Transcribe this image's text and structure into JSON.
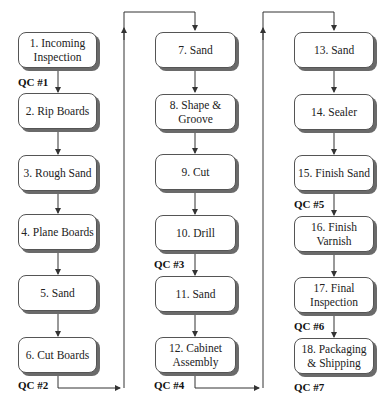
{
  "diagram": {
    "type": "process-flowchart",
    "columns": [
      {
        "steps": [
          {
            "id": 1,
            "label": "1. Incoming Inspection"
          },
          {
            "id": 2,
            "label": "2. Rip Boards"
          },
          {
            "id": 3,
            "label": "3. Rough Sand"
          },
          {
            "id": 4,
            "label": "4. Plane Boards"
          },
          {
            "id": 5,
            "label": "5. Sand"
          },
          {
            "id": 6,
            "label": "6. Cut Boards"
          }
        ]
      },
      {
        "steps": [
          {
            "id": 7,
            "label": "7. Sand"
          },
          {
            "id": 8,
            "label": "8. Shape & Groove"
          },
          {
            "id": 9,
            "label": "9. Cut"
          },
          {
            "id": 10,
            "label": "10. Drill"
          },
          {
            "id": 11,
            "label": "11. Sand"
          },
          {
            "id": 12,
            "label": "12. Cabinet Assembly"
          }
        ]
      },
      {
        "steps": [
          {
            "id": 13,
            "label": "13. Sand"
          },
          {
            "id": 14,
            "label": "14. Sealer"
          },
          {
            "id": 15,
            "label": "15. Finish Sand"
          },
          {
            "id": 16,
            "label": "16. Finish Varnish"
          },
          {
            "id": 17,
            "label": "17. Final Inspection"
          },
          {
            "id": 18,
            "label": "18. Packaging & Shipping"
          }
        ]
      }
    ],
    "quality_checks": [
      {
        "label": "QC #1",
        "after_step": 1
      },
      {
        "label": "QC #2",
        "after_step": 6
      },
      {
        "label": "QC #3",
        "after_step": 10
      },
      {
        "label": "QC #4",
        "after_step": 12
      },
      {
        "label": "QC #5",
        "after_step": 15
      },
      {
        "label": "QC #6",
        "after_step": 17
      },
      {
        "label": "QC #7",
        "after_step": 18
      }
    ],
    "colors": {
      "line": "#333333",
      "shadow": "#6a6a6a",
      "box_fill": "#ffffff"
    }
  }
}
